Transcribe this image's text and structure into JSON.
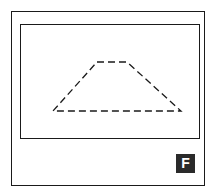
{
  "figure": {
    "label": "F",
    "frame_color": "#1a1a1a",
    "badge_bg": "#2a2a2a",
    "badge_fg": "#ffffff"
  },
  "shape": {
    "type": "trapezoid",
    "style": "dashed",
    "vertices": [
      [
        97,
        62
      ],
      [
        127,
        62
      ],
      [
        181,
        111
      ],
      [
        53,
        111
      ]
    ]
  }
}
